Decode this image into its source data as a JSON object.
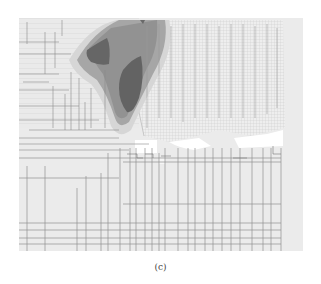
{
  "figure": {
    "caption": "(c)",
    "colors": {
      "background": "#ffffff",
      "plot_base": "#ececec",
      "contour_level_1": "#d4d4d4",
      "contour_level_2": "#a8a8a8",
      "contour_level_3": "#8a8a8a",
      "contour_level_4": "#6a6a6a",
      "mesh_lines": "#8e8e8e",
      "gap_regions": "#ffffff"
    }
  }
}
